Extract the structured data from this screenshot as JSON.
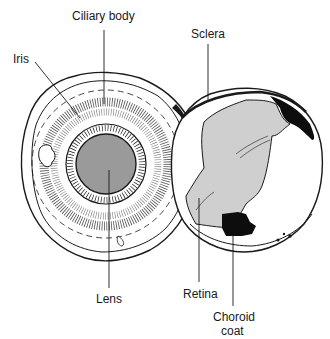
{
  "diagram": {
    "type": "anatomical-illustration",
    "labels": {
      "ciliary_body": "Ciliary body",
      "iris": "Iris",
      "lens": "Lens",
      "sclera": "Sclera",
      "retina": "Retina",
      "choroid_line1": "Choroid",
      "choroid_line2": "coat"
    },
    "parts": [
      {
        "name": "Ciliary body",
        "half": "anterior"
      },
      {
        "name": "Iris",
        "half": "anterior"
      },
      {
        "name": "Lens",
        "half": "anterior"
      },
      {
        "name": "Sclera",
        "half": "posterior"
      },
      {
        "name": "Retina",
        "half": "posterior"
      },
      {
        "name": "Choroid coat",
        "half": "posterior"
      }
    ],
    "colors": {
      "line": "#1a1a1a",
      "lens_fill": "#9a9a9a",
      "retina_fill": "#cfcfcf",
      "choroid_fill": "#0d0d0d",
      "background": "#ffffff"
    }
  }
}
